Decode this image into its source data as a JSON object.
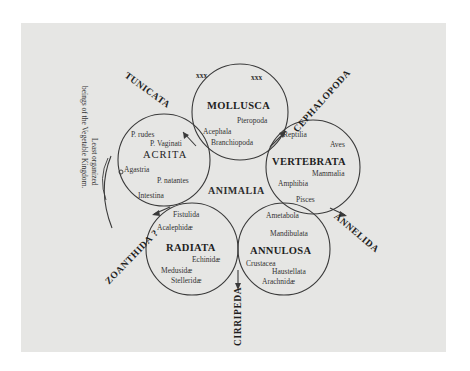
{
  "diagram": {
    "center_label": "ANIMALIA",
    "circles": [
      {
        "name": "MOLLUSCA",
        "cx": 240,
        "cy": 112,
        "r": 48,
        "members": [
          "Pteropoda",
          "Acephala",
          "Branchiopoda"
        ],
        "marks": [
          "xxx",
          "xxx"
        ]
      },
      {
        "name": "VERTEBRATA",
        "cx": 313,
        "cy": 167,
        "r": 47,
        "members": [
          "Reptilia",
          "Aves",
          "Mammalia",
          "Amphibia",
          "Pisces"
        ]
      },
      {
        "name": "ACRITA",
        "cx": 164,
        "cy": 160,
        "r": 46,
        "members": [
          "P. rudes",
          "P. Vaginati",
          "Agastria",
          "P. natantes",
          "Intestina"
        ]
      },
      {
        "name": "RADIATA",
        "cx": 192,
        "cy": 249,
        "r": 46,
        "members": [
          "Fistulida",
          "Acalephidæ",
          "Echinidæ",
          "Medusidæ",
          "Stelleridæ"
        ]
      },
      {
        "name": "ANNULOSA",
        "cx": 284,
        "cy": 249,
        "r": 46,
        "members": [
          "Ametabola",
          "Mandibulata",
          "Crustacea",
          "Haustellata",
          "Arachnidæ"
        ]
      }
    ],
    "osculant_groups": [
      "TUNICATA",
      "CEPHALOPODA",
      "ANNELIDA",
      "CIRRIPEDA",
      "ZOANTHIDA ?"
    ],
    "side_note": {
      "line1": "Least organized",
      "line2": "beings of the Vegetable Kingdom."
    }
  },
  "colors": {
    "paper": "#e6e6e4",
    "ink": "#2a2a2a",
    "background": "#ffffff"
  }
}
